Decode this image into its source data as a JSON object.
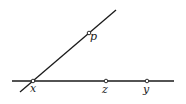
{
  "diagram": {
    "type": "geometry-lines-and-points",
    "lines": [
      {
        "name": "horizontal-line",
        "x1": 12,
        "y1": 81,
        "x2": 174,
        "y2": 81
      },
      {
        "name": "diagonal-line",
        "x1": 20,
        "y1": 92,
        "x2": 116,
        "y2": 10
      }
    ],
    "points": [
      {
        "name": "x",
        "label": "x",
        "cx": 33,
        "cy": 81,
        "lx": 30,
        "ly": 92
      },
      {
        "name": "p",
        "label": "p",
        "cx": 89,
        "cy": 33,
        "lx": 90,
        "ly": 40
      },
      {
        "name": "z",
        "label": "z",
        "cx": 106,
        "cy": 81,
        "lx": 102,
        "ly": 93
      },
      {
        "name": "y",
        "label": "y",
        "cx": 147,
        "cy": 81,
        "lx": 143,
        "ly": 93
      }
    ],
    "colors": {
      "stroke": "#1a1a1a",
      "background": "#ffffff"
    }
  }
}
